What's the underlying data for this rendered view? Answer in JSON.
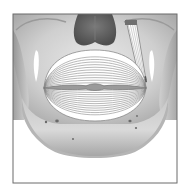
{
  "figure": {
    "subject": "Orbicularis oris muscle over skull (frontal view)",
    "caption": "",
    "parts": {
      "frame": "illustration-frame",
      "skull": "skull-maxilla-and-mandible",
      "nasal_cavity": "nasal-aperture",
      "muscle": "orbicularis-oris",
      "strap_muscle": "levator-strap-muscle",
      "mouth": "oral-fissure",
      "foramina": "mental-foramina"
    },
    "colors": {
      "background": "#ffffff",
      "frame_stroke": "#6b6b6b",
      "bone_light": "#e6e6e6",
      "bone_mid": "#bdbdbd",
      "bone_dark": "#8e8e8e",
      "nasal_dark": "#5a5a5a",
      "muscle_fill": "#ffffff",
      "muscle_stroke": "#8a8a8a",
      "foramen": "#6a6a6a"
    },
    "muscle_fiber_count": 12
  }
}
